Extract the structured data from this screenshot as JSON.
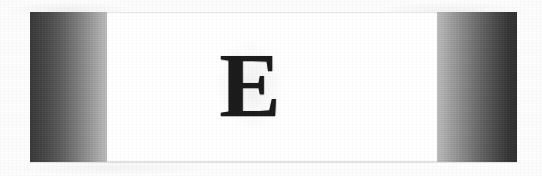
{
  "document": {
    "type": "scanned-page-banner",
    "page_background": "#fdfdfd"
  },
  "banner": {
    "name": "drop-cap-banner",
    "left": 30,
    "top": 12,
    "width": 487,
    "height": 150,
    "center_panel": {
      "background": "#ffffff",
      "border_color": "#e6e6e6"
    },
    "left_block": {
      "label": "left gradient block",
      "width": 77,
      "gradient_direction": "dark-to-light",
      "dark_color": "#383838",
      "light_color": "#bdbdbd"
    },
    "right_block": {
      "label": "right gradient block",
      "width": 80,
      "gradient_direction": "light-to-dark",
      "light_color": "#bdbdbd",
      "dark_color": "#2e2e2e"
    }
  },
  "dropcap": {
    "letter": "E",
    "color": "#1c1c1c",
    "font_size_px": 92,
    "style": "bold serif"
  }
}
